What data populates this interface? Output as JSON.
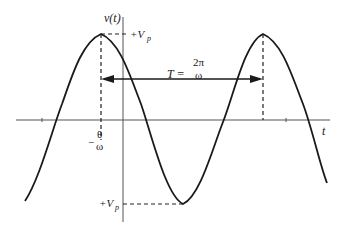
{
  "diagram": {
    "labels": {
      "y_axis": "v(t)",
      "x_axis": "t",
      "peak_top": "+V",
      "peak_top_sub": "p",
      "peak_bottom": "+V",
      "peak_bottom_sub": "p",
      "phase_minus": "−",
      "phase_num": "θ",
      "phase_den": "ω",
      "period_T": "T =",
      "period_num": "2π",
      "period_den": "ω"
    },
    "colors": {
      "curve": "#1a1a1a",
      "axes": "#555555",
      "dashed": "#222222",
      "background": "#ffffff"
    },
    "geometry": {
      "first_peak_x": 101,
      "second_peak_x": 263,
      "trough_x": 183,
      "axis_y": 120,
      "vertical_axis_x": 123,
      "amplitude_px": 85
    }
  }
}
